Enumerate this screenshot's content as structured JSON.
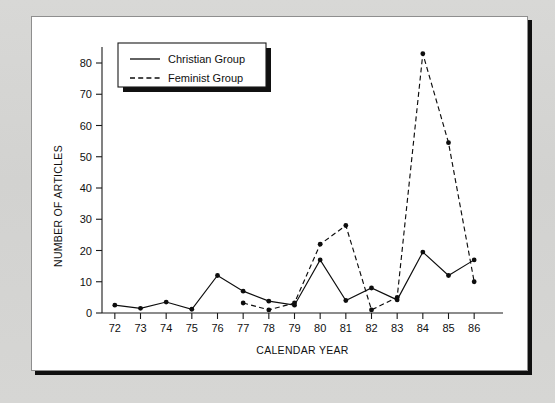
{
  "chart_data": {
    "type": "line",
    "title": "",
    "xlabel": "CALENDAR YEAR",
    "ylabel": "NUMBER OF ARTICLES",
    "categories": [
      "72",
      "73",
      "74",
      "75",
      "76",
      "77",
      "78",
      "79",
      "80",
      "81",
      "82",
      "83",
      "84",
      "85",
      "86"
    ],
    "x": [
      72,
      73,
      74,
      75,
      76,
      77,
      78,
      79,
      80,
      81,
      82,
      83,
      84,
      85,
      86
    ],
    "xlim": [
      71.5,
      86.5
    ],
    "ylim": [
      0,
      86
    ],
    "yticks": [
      0,
      10,
      20,
      30,
      40,
      50,
      60,
      70,
      80
    ],
    "xticks": [
      "72",
      "73",
      "74",
      "75",
      "76",
      "77",
      "78",
      "79",
      "80",
      "81",
      "82",
      "83",
      "84",
      "85",
      "86"
    ],
    "grid": false,
    "legend_position": "top-left",
    "series": [
      {
        "name": "Christian Group",
        "style": "solid",
        "marker": "filled-circle",
        "x": [
          72,
          73,
          74,
          75,
          76,
          77,
          78,
          79,
          80,
          81,
          82,
          83,
          84,
          85,
          86
        ],
        "values": [
          2.5,
          1.5,
          3.5,
          1.2,
          12,
          7,
          3.8,
          2.5,
          17,
          4,
          8,
          4.2,
          19.5,
          12,
          17
        ]
      },
      {
        "name": "Feminist Group",
        "style": "dashed",
        "marker": "filled-circle",
        "x": [
          77,
          78,
          79,
          80,
          81,
          82,
          83,
          84,
          85,
          86
        ],
        "values": [
          3.2,
          1,
          3.2,
          22,
          28,
          1,
          5,
          83,
          54.5,
          10
        ]
      }
    ]
  },
  "legend": {
    "entries": [
      {
        "label": "Christian Group",
        "style": "solid"
      },
      {
        "label": "Feminist Group",
        "style": "dashed"
      }
    ]
  }
}
